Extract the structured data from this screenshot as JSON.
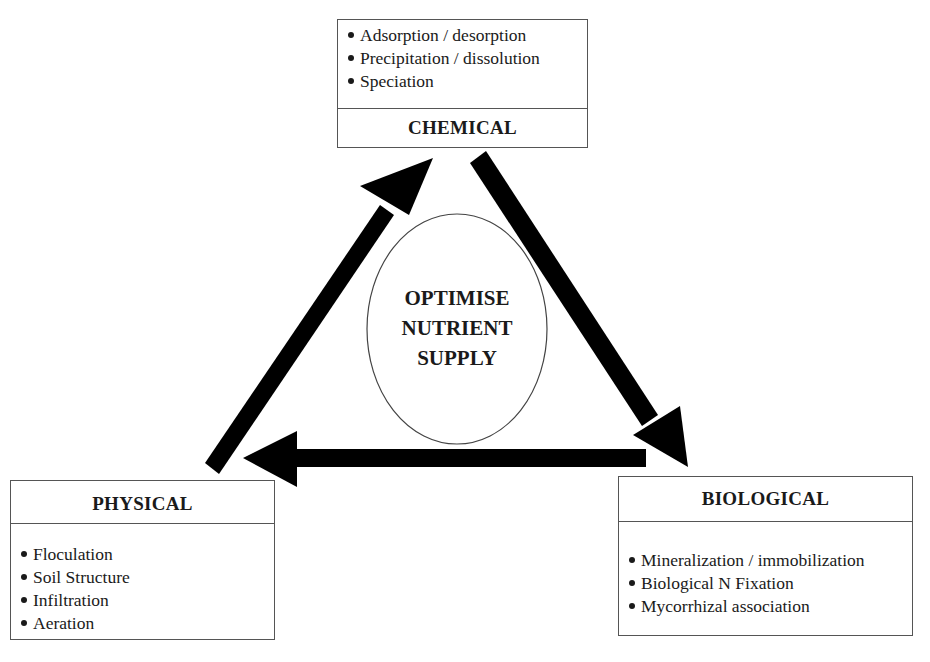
{
  "diagram": {
    "center": {
      "lines": [
        "OPTIMISE",
        "NUTRIENT",
        "SUPPLY"
      ]
    },
    "chemical": {
      "title": "CHEMICAL",
      "items": [
        "Adsorption / desorption",
        "Precipitation / dissolution",
        "Speciation"
      ]
    },
    "physical": {
      "title": "PHYSICAL",
      "items": [
        "Floculation",
        "Soil Structure",
        "Infiltration",
        "Aeration"
      ]
    },
    "biological": {
      "title": "BIOLOGICAL",
      "items": [
        "Mineralization / immobilization",
        "Biological N Fixation",
        "Mycorrhizal association"
      ]
    },
    "arrows": [
      {
        "from": "physical",
        "to": "chemical"
      },
      {
        "from": "chemical",
        "to": "biological"
      },
      {
        "from": "biological",
        "to": "physical"
      }
    ],
    "colors": {
      "arrow": "#000000",
      "border": "#555555",
      "text": "#1a1a1a",
      "background": "#ffffff"
    }
  }
}
